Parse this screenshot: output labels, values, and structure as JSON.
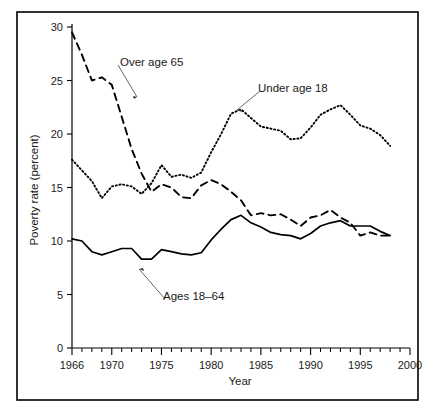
{
  "figure": {
    "background_color": "#ffffff",
    "line_color": "#000000",
    "frame": {
      "x": 17,
      "y": 12,
      "width": 401,
      "height": 388
    }
  },
  "chart_data": {
    "type": "line",
    "title": "",
    "xlabel": "Year",
    "ylabel": "Poverty rate (percent)",
    "xlim": [
      1966,
      2000
    ],
    "ylim": [
      0,
      30
    ],
    "grid": false,
    "legend_position": "inline-annotations",
    "x_major_ticks": [
      1966,
      1970,
      1975,
      1980,
      1985,
      1990,
      1995,
      2000
    ],
    "x_major_tick_labels": [
      "1966",
      "1970",
      "1975",
      "1980",
      "1985",
      "1990",
      "1995",
      "2000"
    ],
    "x_minor_tick_step": 1,
    "y_major_ticks": [
      0,
      5,
      10,
      15,
      20,
      25,
      30
    ],
    "y_major_tick_labels": [
      "0",
      "5",
      "10",
      "15",
      "20",
      "25",
      "30"
    ],
    "x": [
      1966,
      1967,
      1968,
      1969,
      1970,
      1971,
      1972,
      1973,
      1974,
      1975,
      1976,
      1977,
      1978,
      1979,
      1980,
      1981,
      1982,
      1983,
      1984,
      1985,
      1986,
      1987,
      1988,
      1989,
      1990,
      1991,
      1992,
      1993,
      1994,
      1995,
      1996,
      1997,
      1998
    ],
    "series": [
      {
        "name": "Over age 65",
        "style": "dashed",
        "label_text": "Over age 65",
        "values": [
          29.5,
          27.4,
          25.0,
          25.3,
          24.6,
          21.6,
          18.6,
          16.3,
          14.6,
          15.3,
          15.0,
          14.1,
          14.0,
          15.2,
          15.7,
          15.3,
          14.6,
          13.8,
          12.4,
          12.6,
          12.4,
          12.5,
          12.0,
          11.4,
          12.2,
          12.4,
          12.9,
          12.2,
          11.7,
          10.5,
          10.8,
          10.5,
          10.5
        ]
      },
      {
        "name": "Under age 18",
        "style": "dotted",
        "label_text": "Under age 18",
        "values": [
          17.6,
          16.6,
          15.6,
          14.0,
          15.1,
          15.3,
          15.1,
          14.4,
          15.4,
          17.1,
          16.0,
          16.2,
          15.9,
          16.4,
          18.3,
          20.0,
          21.9,
          22.3,
          21.5,
          20.7,
          20.5,
          20.3,
          19.5,
          19.6,
          20.6,
          21.8,
          22.3,
          22.7,
          21.8,
          20.8,
          20.5,
          19.9,
          18.9
        ]
      },
      {
        "name": "Ages 18–64",
        "style": "solid",
        "label_text": "Ages 18–64",
        "values": [
          10.2,
          10.0,
          9.0,
          8.7,
          9.0,
          9.3,
          9.3,
          8.3,
          8.3,
          9.2,
          9.0,
          8.8,
          8.7,
          8.9,
          10.1,
          11.1,
          12.0,
          12.4,
          11.7,
          11.3,
          10.8,
          10.6,
          10.5,
          10.2,
          10.7,
          11.4,
          11.7,
          11.9,
          11.4,
          11.4,
          11.4,
          10.9,
          10.5
        ]
      }
    ],
    "annotations": [
      {
        "text": "Over age 65",
        "label_x": 120,
        "label_y": 62,
        "anchor_x": 137,
        "anchor_y": 97
      },
      {
        "text": "Under age 18",
        "label_x": 258,
        "label_y": 88,
        "anchor_x": 237,
        "anchor_y": 110
      },
      {
        "text": "Ages 18–64",
        "label_x": 163,
        "label_y": 296,
        "anchor_x": 139,
        "anchor_y": 269
      }
    ]
  }
}
